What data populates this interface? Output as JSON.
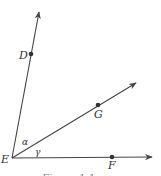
{
  "diagram": {
    "type": "geometry-angles",
    "vertex": {
      "label": "E",
      "x": 12,
      "y": 158
    },
    "rays": [
      {
        "name": "ray-ED",
        "through": "D",
        "tip": {
          "x": 39,
          "y": 12
        }
      },
      {
        "name": "ray-EG",
        "through": "G",
        "tip": {
          "x": 136,
          "y": 83
        }
      },
      {
        "name": "ray-EF",
        "through": "F",
        "tip": {
          "x": 152,
          "y": 157
        }
      }
    ],
    "points": [
      {
        "label": "D",
        "x": 31,
        "y": 54
      },
      {
        "label": "G",
        "x": 98,
        "y": 105
      },
      {
        "label": "F",
        "x": 112,
        "y": 157
      }
    ],
    "angles": [
      {
        "label": "α",
        "between": [
          "ED",
          "EG"
        ]
      },
      {
        "label": "γ",
        "between": [
          "EG",
          "EF"
        ]
      }
    ],
    "labels": {
      "D": "D",
      "G": "G",
      "E": "E",
      "F": "F",
      "alpha": "α",
      "gamma": "γ"
    },
    "caption": "Figure 1.1"
  }
}
